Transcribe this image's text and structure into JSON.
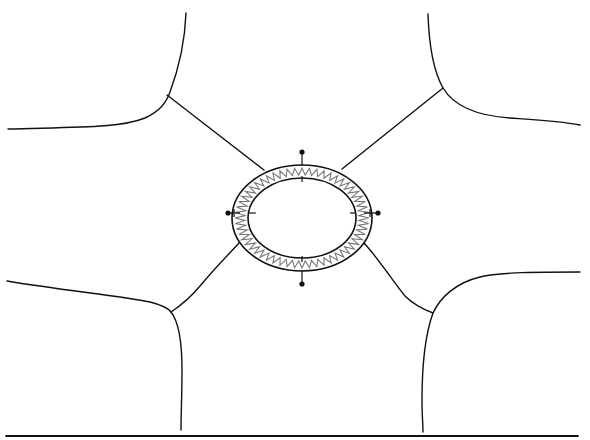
{
  "diagram": {
    "colors": {
      "line": "#111111",
      "zigzag": "#777777",
      "background": "#ffffff"
    },
    "ring": {
      "center": [
        302,
        218
      ],
      "outer": {
        "rx": 70,
        "ry": 53
      },
      "inner": {
        "rx": 54,
        "ry": 40
      },
      "zigzag_teeth": 56
    },
    "pins": [
      {
        "name": "top",
        "dot": [
          302,
          152
        ],
        "tick_y": 165
      },
      {
        "name": "left",
        "dot": [
          228,
          213
        ]
      },
      {
        "name": "right",
        "dot": [
          378,
          213
        ]
      },
      {
        "name": "bottom",
        "dot": [
          302,
          284
        ]
      }
    ],
    "boundaries": [
      {
        "name": "upper-left",
        "junction": [
          167,
          95
        ]
      },
      {
        "name": "upper-right",
        "junction": [
          443,
          88
        ]
      },
      {
        "name": "lower-left",
        "junction": [
          171,
          312
        ]
      },
      {
        "name": "lower-right",
        "junction": [
          433,
          313
        ]
      }
    ],
    "baseline": {
      "y": 436,
      "x1": 6,
      "x2": 578
    }
  }
}
